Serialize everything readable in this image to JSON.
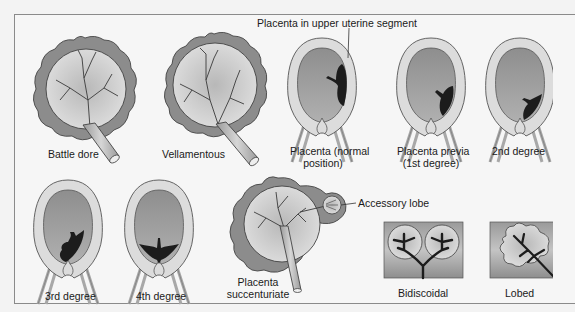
{
  "figure": {
    "colors": {
      "background": "#f6f6f6",
      "frame": "#8a8a8a",
      "placenta_outer": "#8c8c8c",
      "placenta_inner": "#c8c8c8",
      "vessels": "#3a3a3a",
      "uterus_wall": "#dcdcdc",
      "uterus_cavity": "#9c9c9c",
      "placenta_dark": "#1c1c1c",
      "text": "#1a1a1a"
    },
    "panels": [
      {
        "id": "battledore",
        "label": "Battle dore"
      },
      {
        "id": "velamentous",
        "label": "Vellamentous"
      },
      {
        "id": "normal",
        "label_line1": "Placenta (normal",
        "label_line2": "position)"
      },
      {
        "id": "previa1",
        "label_line1": "Placenta previa",
        "label_line2": "(1st degree)"
      },
      {
        "id": "previa2",
        "label": "2nd degree"
      },
      {
        "id": "previa3",
        "label": "3rd degree"
      },
      {
        "id": "previa4",
        "label": "4th degree"
      },
      {
        "id": "succenturiate",
        "label_line1": "Placenta",
        "label_line2": "succenturiate"
      },
      {
        "id": "bidiscoidal",
        "label": "Bidiscoidal"
      },
      {
        "id": "lobed",
        "label": "Lobed"
      }
    ],
    "callouts": {
      "upper_segment": "Placenta in upper uterine segment",
      "accessory_lobe": "Accessory lobe"
    }
  }
}
